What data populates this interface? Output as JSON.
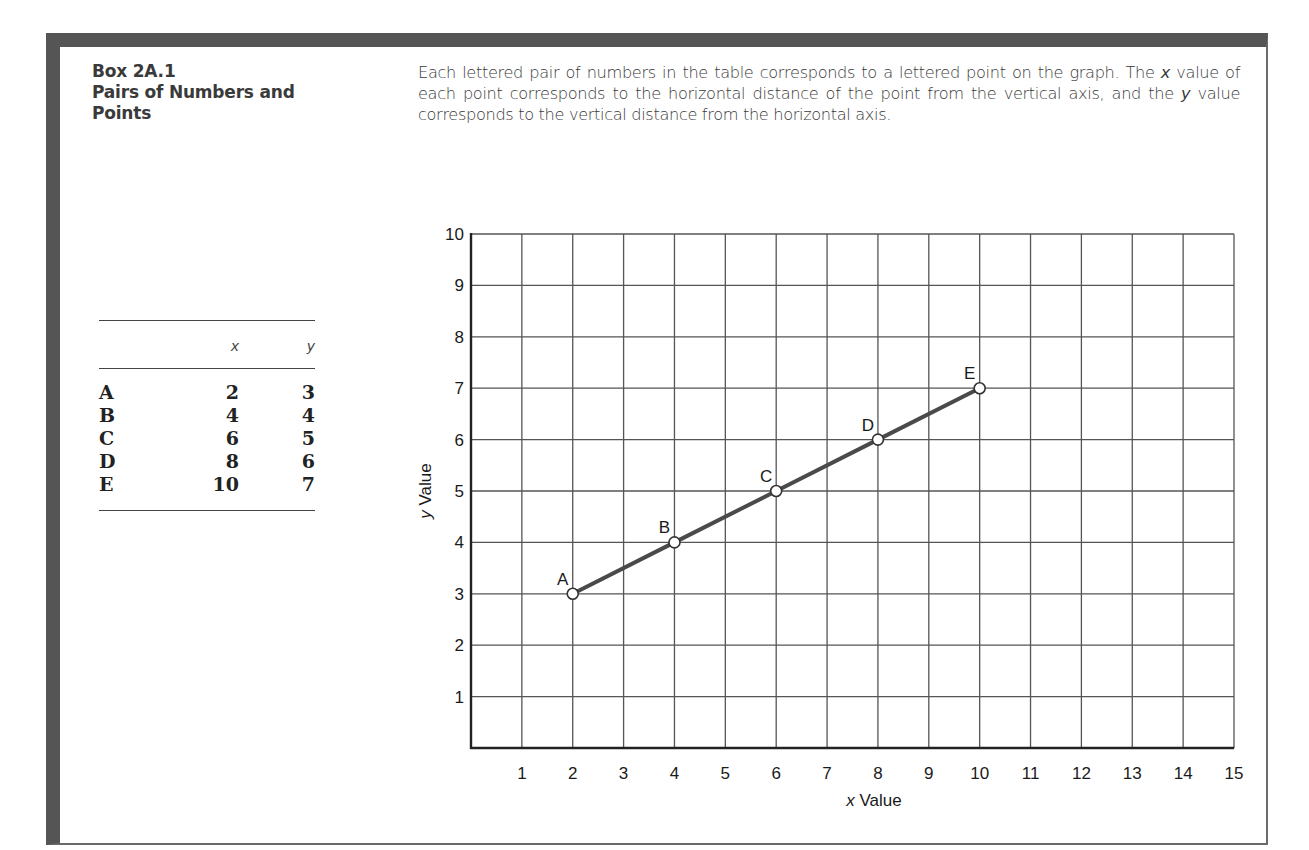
{
  "box": {
    "number": "Box 2A.1",
    "title_line1": "Pairs of Numbers and",
    "title_line2": "Points"
  },
  "caption": {
    "part1": "Each lettered pair of numbers in the table corresponds to a lettered point on the graph. The ",
    "x_var": "x",
    "part2": " value of each point corresponds to the horizontal distance of the point from the vertical axis, and the ",
    "y_var": "y",
    "part3": " value corresponds to the vertical distance from the horizontal axis."
  },
  "table": {
    "headers": [
      "",
      "x",
      "y"
    ],
    "rows": [
      {
        "label": "A",
        "x": "2",
        "y": "3"
      },
      {
        "label": "B",
        "x": "4",
        "y": "4"
      },
      {
        "label": "C",
        "x": "6",
        "y": "5"
      },
      {
        "label": "D",
        "x": "8",
        "y": "6"
      },
      {
        "label": "E",
        "x": "10",
        "y": "7"
      }
    ]
  },
  "colors": {
    "frame": "#555555",
    "grid": "#555555",
    "line": "#4a4a4a",
    "point_fill": "#ffffff"
  },
  "chart_data": {
    "type": "line",
    "title": "",
    "xlabel_var": "x",
    "xlabel": "Value",
    "ylabel_var": "y",
    "ylabel": "Value",
    "xlim": [
      0,
      15
    ],
    "ylim": [
      0,
      10
    ],
    "x_ticks": [
      1,
      2,
      3,
      4,
      5,
      6,
      7,
      8,
      9,
      10,
      11,
      12,
      13,
      14,
      15
    ],
    "y_ticks": [
      1,
      2,
      3,
      4,
      5,
      6,
      7,
      8,
      9,
      10
    ],
    "grid": true,
    "legend": null,
    "series": [
      {
        "name": "Lettered points",
        "points": [
          {
            "label": "A",
            "x": 2,
            "y": 3
          },
          {
            "label": "B",
            "x": 4,
            "y": 4
          },
          {
            "label": "C",
            "x": 6,
            "y": 5
          },
          {
            "label": "D",
            "x": 8,
            "y": 6
          },
          {
            "label": "E",
            "x": 10,
            "y": 7
          }
        ]
      }
    ]
  }
}
